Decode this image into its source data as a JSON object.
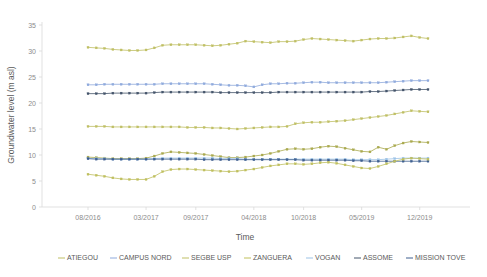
{
  "chart_data": {
    "type": "line",
    "title": "",
    "xlabel": "Time",
    "ylabel": "Groundwater level (m asl)",
    "ylim": [
      0,
      35
    ],
    "yticks": [
      0,
      5,
      10,
      15,
      20,
      25,
      30,
      35
    ],
    "xticks": [
      "08/2016",
      "03/2017",
      "09/2017",
      "04/2018",
      "10/2018",
      "05/2019",
      "12/2019"
    ],
    "xtick_positions": [
      0,
      7,
      13,
      20,
      26,
      33,
      40
    ],
    "grid": false,
    "legend_position": "bottom",
    "x_count": 42,
    "series": [
      {
        "name": "ATIEGOU",
        "color": "#bfbf64",
        "values": [
          30.7,
          30.6,
          30.5,
          30.3,
          30.2,
          30.1,
          30.1,
          30.2,
          30.6,
          31.1,
          31.2,
          31.2,
          31.2,
          31.2,
          31.1,
          31.0,
          31.1,
          31.3,
          31.5,
          31.9,
          31.8,
          31.7,
          31.6,
          31.8,
          31.8,
          31.9,
          32.2,
          32.4,
          32.3,
          32.2,
          32.1,
          32.0,
          31.9,
          32.1,
          32.3,
          32.4,
          32.4,
          32.5,
          32.7,
          32.9,
          32.6,
          32.4
        ]
      },
      {
        "name": "CAMPUS NORD",
        "color": "#8faadc",
        "values": [
          23.5,
          23.5,
          23.6,
          23.6,
          23.6,
          23.6,
          23.6,
          23.6,
          23.6,
          23.7,
          23.7,
          23.7,
          23.7,
          23.7,
          23.7,
          23.6,
          23.5,
          23.4,
          23.4,
          23.3,
          23.1,
          23.5,
          23.7,
          23.7,
          23.8,
          23.8,
          23.9,
          24.0,
          24.0,
          23.9,
          23.9,
          23.9,
          23.9,
          23.9,
          23.9,
          23.9,
          24.0,
          24.1,
          24.2,
          24.3,
          24.3,
          24.3
        ]
      },
      {
        "name": "SEGBE USP",
        "color": "#bfbf64",
        "values": [
          15.5,
          15.5,
          15.5,
          15.4,
          15.4,
          15.4,
          15.4,
          15.4,
          15.4,
          15.4,
          15.4,
          15.4,
          15.3,
          15.3,
          15.3,
          15.2,
          15.2,
          15.1,
          15.0,
          15.1,
          15.2,
          15.3,
          15.4,
          15.4,
          15.5,
          16.0,
          16.2,
          16.3,
          16.3,
          16.4,
          16.5,
          16.6,
          16.8,
          17.0,
          17.2,
          17.4,
          17.6,
          17.9,
          18.2,
          18.5,
          18.4,
          18.3
        ]
      },
      {
        "name": "ZANGUERA",
        "color": "#a9a94e",
        "values": [
          9.6,
          9.5,
          9.4,
          9.3,
          9.3,
          9.3,
          9.3,
          9.4,
          9.8,
          10.3,
          10.6,
          10.5,
          10.4,
          10.3,
          10.1,
          9.9,
          9.7,
          9.5,
          9.5,
          9.6,
          9.8,
          10.0,
          10.3,
          10.7,
          11.1,
          11.2,
          11.1,
          11.2,
          11.5,
          11.7,
          11.6,
          11.3,
          11.0,
          10.7,
          10.6,
          11.5,
          11.1,
          11.8,
          12.3,
          12.6,
          12.5,
          12.4
        ]
      },
      {
        "name": "VOGAN",
        "color": "#9dc3e6",
        "values": [
          9.3,
          9.3,
          9.3,
          9.2,
          9.2,
          9.2,
          9.2,
          9.2,
          9.3,
          9.4,
          9.4,
          9.4,
          9.4,
          9.4,
          9.4,
          9.4,
          9.3,
          9.3,
          9.3,
          9.2,
          9.2,
          9.2,
          9.2,
          9.2,
          9.2,
          9.2,
          9.2,
          9.2,
          9.2,
          9.2,
          9.2,
          9.2,
          9.1,
          9.1,
          9.1,
          9.1,
          9.2,
          9.3,
          9.4,
          9.4,
          9.4,
          9.4
        ]
      },
      {
        "name": "ASSOME",
        "color": "#44546a",
        "values": [
          21.8,
          21.8,
          21.8,
          21.9,
          21.9,
          21.9,
          21.9,
          21.9,
          22.0,
          22.1,
          22.1,
          22.1,
          22.1,
          22.1,
          22.1,
          22.1,
          22.0,
          22.0,
          22.0,
          22.0,
          22.0,
          22.0,
          22.0,
          22.1,
          22.1,
          22.1,
          22.1,
          22.1,
          22.1,
          22.1,
          22.1,
          22.1,
          22.1,
          22.1,
          22.2,
          22.2,
          22.3,
          22.4,
          22.5,
          22.6,
          22.6,
          22.6
        ]
      },
      {
        "name": "MISSION TOVE",
        "color": "#3f5f8f",
        "values": [
          9.3,
          9.2,
          9.2,
          9.2,
          9.2,
          9.2,
          9.2,
          9.2,
          9.2,
          9.2,
          9.2,
          9.2,
          9.2,
          9.2,
          9.1,
          9.1,
          9.1,
          9.1,
          9.1,
          9.1,
          9.1,
          9.1,
          9.1,
          9.1,
          9.1,
          9.1,
          9.0,
          9.0,
          9.0,
          9.0,
          9.0,
          9.0,
          8.9,
          8.9,
          8.8,
          8.8,
          8.8,
          8.8,
          8.8,
          8.8,
          8.8,
          8.8
        ]
      },
      {
        "name": "ZANGUERA_LOW",
        "color": "#bfbf5f",
        "hidden_legend": true,
        "values": [
          6.3,
          6.1,
          5.9,
          5.6,
          5.4,
          5.3,
          5.3,
          5.3,
          5.9,
          6.8,
          7.2,
          7.3,
          7.3,
          7.2,
          7.1,
          7.0,
          6.9,
          6.8,
          6.9,
          7.1,
          7.3,
          7.6,
          7.9,
          8.1,
          8.3,
          8.3,
          8.2,
          8.3,
          8.5,
          8.6,
          8.4,
          8.1,
          7.8,
          7.5,
          7.4,
          7.8,
          8.3,
          8.8,
          9.2,
          9.4,
          9.3,
          9.2
        ]
      }
    ]
  },
  "legend": {
    "items": [
      {
        "label": "ATIEGOU",
        "color": "#bfbf64"
      },
      {
        "label": "CAMPUS NORD",
        "color": "#8faadc"
      },
      {
        "label": "SEGBE USP",
        "color": "#bfbf64"
      },
      {
        "label": "ZANGUERA",
        "color": "#c0c05a"
      },
      {
        "label": "VOGAN",
        "color": "#9dc3e6"
      },
      {
        "label": "ASSOME",
        "color": "#44546a"
      },
      {
        "label": "MISSION TOVE",
        "color": "#3f5f8f"
      }
    ]
  }
}
